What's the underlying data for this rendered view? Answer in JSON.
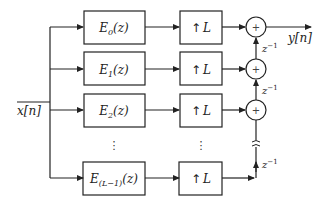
{
  "diagram": {
    "type": "polyphase-interpolator-block-diagram",
    "input": {
      "label": "x[n]"
    },
    "output": {
      "label": "y[n]"
    },
    "branches": [
      {
        "filter": {
          "name": "E",
          "sub": "0",
          "arg": "(z)"
        },
        "upsampler": {
          "arrow": "↑",
          "label": "L"
        }
      },
      {
        "filter": {
          "name": "E",
          "sub": "1",
          "arg": "(z)"
        },
        "upsampler": {
          "arrow": "↑",
          "label": "L"
        }
      },
      {
        "filter": {
          "name": "E",
          "sub": "2",
          "arg": "(z)"
        },
        "upsampler": {
          "arrow": "↑",
          "label": "L"
        }
      },
      {
        "filter": {
          "name": "E",
          "sub": "(L−1)",
          "arg": "(z)"
        },
        "upsampler": {
          "arrow": "↑",
          "label": "L"
        }
      }
    ],
    "ellipsis": "⋮",
    "adders": [
      {
        "symbol": "+"
      },
      {
        "symbol": "+"
      },
      {
        "symbol": "+"
      }
    ],
    "delays": [
      {
        "base": "z",
        "exp": "−1"
      },
      {
        "base": "z",
        "exp": "−1"
      },
      {
        "base": "z",
        "exp": "−1"
      }
    ],
    "colors": {
      "line": "#222222",
      "background": "#ffffff"
    }
  }
}
